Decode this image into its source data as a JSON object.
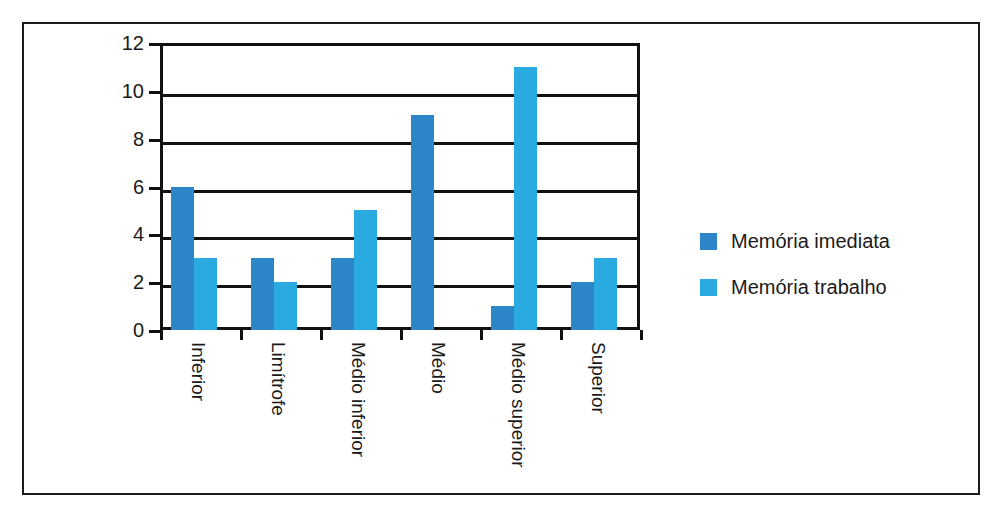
{
  "chart_data": {
    "type": "bar",
    "title": "",
    "subtitle": "",
    "xlabel": "",
    "ylabel": "",
    "categories": [
      "Inferior",
      "Limítrofe",
      "Médio inferior",
      "Médio",
      "Médio superior",
      "Superior"
    ],
    "series": [
      {
        "name": "Memória imediata",
        "color": "#2E86C8",
        "values": [
          6,
          3,
          3,
          9,
          1,
          2
        ]
      },
      {
        "name": "Memória trabalho",
        "color": "#29ABE2",
        "values": [
          3,
          2,
          5,
          0,
          11,
          3
        ]
      }
    ],
    "ylim": [
      0,
      12
    ],
    "yticks": [
      0,
      2,
      4,
      6,
      8,
      10,
      12
    ],
    "ytick_labels": [
      "0",
      "2",
      "4",
      "6",
      "8",
      "10",
      "12"
    ],
    "grid": "horizontal",
    "legend_position": "right",
    "annotations": []
  },
  "legend": {
    "entries": [
      {
        "label": "Memória imediata"
      },
      {
        "label": "Memória trabalho"
      }
    ]
  },
  "colors": {
    "series_0": "#2E86C8",
    "series_1": "#29ABE2",
    "axis": "#111111",
    "frame": "#1b1b1b",
    "text": "#1a1a1a",
    "background": "#ffffff"
  }
}
